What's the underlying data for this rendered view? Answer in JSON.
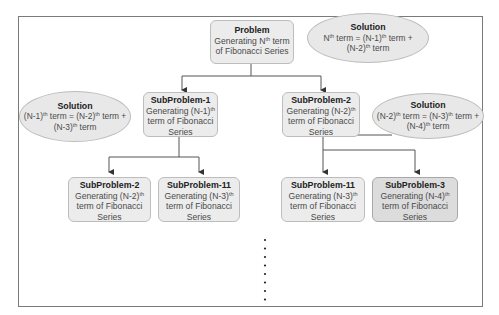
{
  "diagram": {
    "type": "recursion-tree",
    "problem": {
      "title": "Problem",
      "line1": "Generating N",
      "line1_sup": "th",
      "line1_end": " term",
      "line2": "of Fibonacci Series"
    },
    "solution_top": {
      "title": "Solution",
      "a": "N",
      "a_sup": "th",
      "b": " term = (N-1)",
      "b_sup": "th",
      "c": " term +",
      "d": "(N-2)",
      "d_sup": "th",
      "e": " term"
    },
    "solution_left": {
      "title": "Solution",
      "a": "(N-1)",
      "a_sup": "th",
      "b": " term = (N-2)",
      "b_sup": "th",
      "c": " term +",
      "d": "(N-3)",
      "d_sup": "th",
      "e": " term"
    },
    "solution_right": {
      "title": "Solution",
      "a": "(N-2)",
      "a_sup": "th",
      "b": " term = (N-3)",
      "b_sup": "th",
      "c": " term +",
      "d": "(N-4)",
      "d_sup": "th",
      "e": " term"
    },
    "subproblems": [
      {
        "title": "SubProblem-1",
        "l1": "Generating (N-1)",
        "sup": "th",
        "l2": "term of Fibonacci",
        "l3": "Series"
      },
      {
        "title": "SubProblem-2",
        "l1": "Generating (N-2)",
        "sup": "th",
        "l2": "term of Fibonacci",
        "l3": "Series"
      },
      {
        "title": "SubProblem-2",
        "l1": "Generating (N-2)",
        "sup": "th",
        "l2": "term of Fibonacci",
        "l3": "Series"
      },
      {
        "title": "SubProblem-11",
        "l1": "Generating (N-3)",
        "sup": "th",
        "l2": "term of Fibonacci",
        "l3": "Series"
      },
      {
        "title": "SubProblem-11",
        "l1": "Generating (N-3)",
        "sup": "th",
        "l2": "term of Fibonacci",
        "l3": "Series"
      },
      {
        "title": "SubProblem-3",
        "l1": "Generating (N-4)",
        "sup": "th",
        "l2": "term of Fibonacci",
        "l3": "Series"
      }
    ],
    "continuation": "⋮",
    "colors": {
      "node_fill": "#ececec",
      "highlight_fill": "#dcdcdc",
      "ellipse_fill": "#e8e8e8",
      "line": "#555555",
      "frame": "#7a7a7a"
    }
  }
}
